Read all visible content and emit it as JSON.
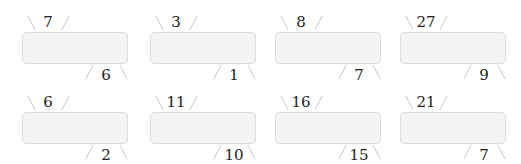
{
  "diagram": {
    "type": "number-pair-cards",
    "rows": 2,
    "columns": 4,
    "cells": [
      {
        "top": "7",
        "bottom": "6"
      },
      {
        "top": "3",
        "bottom": "1"
      },
      {
        "top": "8",
        "bottom": "7"
      },
      {
        "top": "27",
        "bottom": "9"
      },
      {
        "top": "6",
        "bottom": "2"
      },
      {
        "top": "11",
        "bottom": "10"
      },
      {
        "top": "16",
        "bottom": "15"
      },
      {
        "top": "21",
        "bottom": "7"
      }
    ],
    "colors": {
      "box_fill": "#f4f4f4",
      "box_border": "#dcdcdc",
      "line": "#cfcfcf",
      "text": "#222222"
    }
  }
}
